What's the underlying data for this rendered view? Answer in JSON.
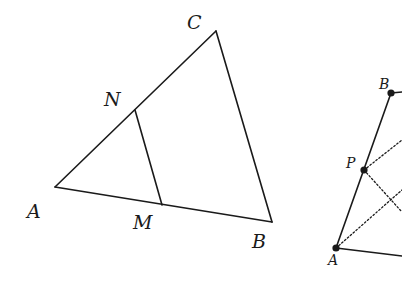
{
  "figure_left": {
    "title": "Triangle ABC with segment MN",
    "stroke_color": "#1a1a1a",
    "labels": {
      "A": "A",
      "B": "B",
      "C": "C",
      "M": "M",
      "N": "N"
    },
    "points": {
      "A": [
        55,
        187
      ],
      "B": [
        272,
        222
      ],
      "C": [
        216,
        31
      ],
      "N": [
        135,
        110
      ],
      "M": [
        162,
        205
      ]
    },
    "segments": [
      [
        "A",
        "B"
      ],
      [
        "B",
        "C"
      ],
      [
        "C",
        "A"
      ],
      [
        "N",
        "M"
      ]
    ]
  },
  "figure_right": {
    "title": "Partial figure with points A, P, B",
    "stroke_color": "#1a1a1a",
    "labels": {
      "A": "A",
      "P": "P",
      "B": "B"
    },
    "points": {
      "A": [
        336,
        248
      ],
      "P": [
        364,
        170
      ],
      "B": [
        391,
        93
      ]
    },
    "solid_segments": [
      [
        "A",
        "B"
      ],
      [
        "A",
        "edge_right_bottom"
      ],
      [
        "B",
        "edge_right_top"
      ]
    ],
    "dotted_segments": [
      [
        "P",
        "up-right"
      ],
      [
        "P",
        "down-right"
      ],
      [
        "A",
        "up-right"
      ]
    ]
  }
}
